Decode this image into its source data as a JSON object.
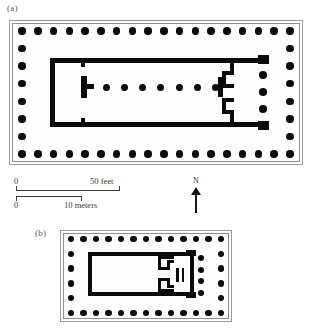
{
  "figure": {
    "caption_a": "(a)",
    "caption_b": "(b)",
    "ink_color": "#0b0b0b",
    "frame_color": "#9a9a9a"
  },
  "scale": {
    "feet_zero": "0",
    "feet_max": "50 feet",
    "meters_zero": "0",
    "meters_max": "10 meters"
  },
  "compass": {
    "label": "N"
  },
  "plan_a": {
    "name": "(a)",
    "peristyle_top_count": 18,
    "peristyle_bottom_count": 18,
    "peristyle_left_count": 8,
    "peristyle_right_count": 8,
    "interior_column_count": 7,
    "porch_column_count": 3
  },
  "plan_b": {
    "name": "(b)",
    "peristyle_top_count": 13,
    "peristyle_bottom_count": 13,
    "peristyle_left_count": 6,
    "peristyle_right_count": 6,
    "porch_column_count": 4
  }
}
